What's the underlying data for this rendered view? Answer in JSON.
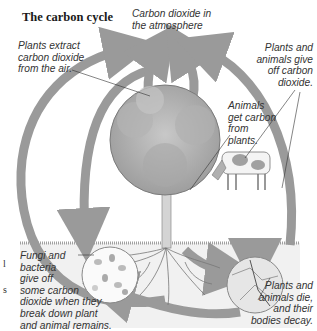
{
  "title": "The carbon cycle",
  "labels": {
    "atmosphere": [
      "Carbon dioxide in",
      "the atmosphere"
    ],
    "plants_extract": [
      "Plants extract",
      "carbon dioxide",
      "from the air."
    ],
    "give_off": [
      "Plants and",
      "animals give",
      "off carbon",
      "dioxide."
    ],
    "animals_get": [
      "Animals",
      "get carbon",
      "from",
      "plants."
    ],
    "fungi": [
      "Fungi and",
      "bacteria",
      "give off",
      "some carbon",
      "dioxide when they",
      "break down plant",
      "and animal remains."
    ],
    "decay": [
      "Plants and",
      "animals die,",
      "and their",
      "bodies decay."
    ]
  },
  "edge_fragments": [
    "l",
    "s"
  ],
  "colors": {
    "arrow": "#9a9a9a",
    "ground": "#eeeeee",
    "foliage": "#a8a8a8",
    "text": "#333333"
  }
}
